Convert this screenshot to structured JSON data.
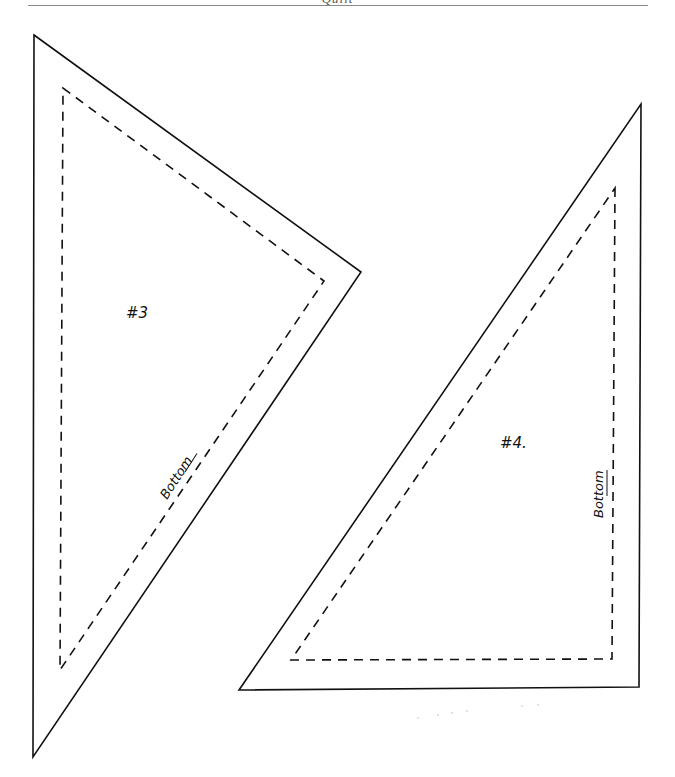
{
  "header": {
    "title": "Quilt"
  },
  "pieces": [
    {
      "id": "piece-3",
      "label": "#3",
      "edge_label": "Bottom",
      "outer": [
        [
          34,
          35
        ],
        [
          361,
          272
        ],
        [
          33,
          757
        ]
      ],
      "inner": [
        [
          63,
          88
        ],
        [
          324,
          281
        ],
        [
          60,
          670
        ]
      ]
    },
    {
      "id": "piece-4",
      "label": "#4.",
      "edge_label": "Bottom",
      "outer": [
        [
          641,
          104
        ],
        [
          639,
          687
        ],
        [
          239,
          690
        ]
      ],
      "inner": [
        [
          615,
          188
        ],
        [
          612,
          659
        ],
        [
          291,
          660
        ]
      ]
    }
  ],
  "colors": {
    "line": "#111111",
    "rule": "#8a8a8a",
    "background": "#ffffff"
  }
}
